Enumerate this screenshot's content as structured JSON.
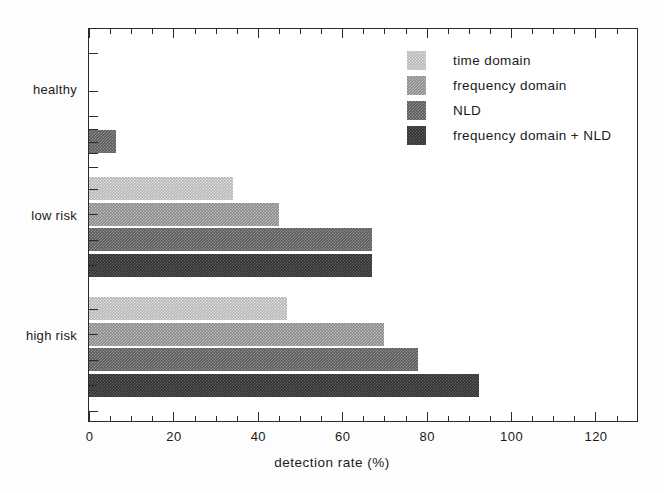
{
  "chart_data": {
    "type": "bar",
    "orientation": "horizontal",
    "title": "",
    "subtitle": "",
    "xlabel": "detection rate (%)",
    "ylabel": "",
    "categories": [
      "healthy",
      "low risk",
      "high risk"
    ],
    "series": [
      {
        "name": "time domain",
        "color": "#b6b6b6",
        "values": [
          0,
          34,
          47
        ]
      },
      {
        "name": "frequency domain",
        "color": "#8a8a8a",
        "values": [
          0,
          45,
          70
        ]
      },
      {
        "name": "NLD",
        "color": "#5a5a5a",
        "values": [
          6.5,
          67,
          78
        ]
      },
      {
        "name": "frequency domain + NLD",
        "color": "#333333",
        "values": [
          0,
          67,
          92.5
        ]
      }
    ],
    "xlim": [
      0,
      129.6
    ],
    "ylim": [
      0,
      13
    ],
    "xticks": [
      0,
      20,
      40,
      60,
      80,
      100,
      120
    ],
    "xtick_labels": [
      "0",
      "20",
      "40",
      "60",
      "80",
      "100",
      "120"
    ],
    "x_minor_tick_step": 5,
    "grid": false,
    "legend_position": "upper right",
    "frame": true
  },
  "axes": {
    "x_axis_title": "detection rate (%)",
    "x_tick_labels": [
      "0",
      "20",
      "40",
      "60",
      "80",
      "100",
      "120"
    ],
    "y_tick_labels": [
      "healthy",
      "low risk",
      "high risk"
    ]
  },
  "legend": {
    "items": [
      {
        "label": "time domain",
        "swatch": "swatch-time-domain"
      },
      {
        "label": "frequency domain",
        "swatch": "swatch-frequency-domain"
      },
      {
        "label": "NLD",
        "swatch": "swatch-nld"
      },
      {
        "label": "frequency domain + NLD",
        "swatch": "swatch-frequency-domain-nld"
      }
    ]
  }
}
